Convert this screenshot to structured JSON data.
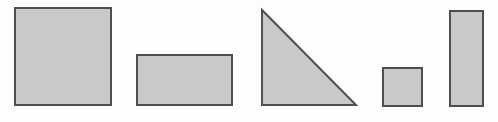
{
  "canvas": {
    "name": "geometric-shapes-figure",
    "width": 498,
    "height": 122,
    "background_color": "#fdfdfd",
    "baseline_y": 106,
    "shape_count": 5
  },
  "style": {
    "fill_color": "#c9c9c9",
    "stroke_color": "#4f4f4f",
    "stroke_width": 2
  },
  "shapes": [
    {
      "id": "shape-1",
      "name": "large-square",
      "kind": "square",
      "x": 15,
      "y": 8,
      "width": 96,
      "height": 97,
      "points": "",
      "fill": "#c9c9c9",
      "stroke": "#4f4f4f"
    },
    {
      "id": "shape-2",
      "name": "wide-rectangle",
      "kind": "rectangle",
      "x": 137,
      "y": 55,
      "width": 95,
      "height": 50,
      "points": "",
      "fill": "#c9c9c9",
      "stroke": "#4f4f4f"
    },
    {
      "id": "shape-3",
      "name": "right-triangle",
      "kind": "triangle",
      "x": 261,
      "y": 9,
      "width": 96,
      "height": 97,
      "points": "262,10 262,105 356,105",
      "fill": "#c9c9c9",
      "stroke": "#4f4f4f"
    },
    {
      "id": "shape-4",
      "name": "small-square",
      "kind": "square",
      "x": 383,
      "y": 68,
      "width": 39,
      "height": 38,
      "points": "",
      "fill": "#c9c9c9",
      "stroke": "#4f4f4f"
    },
    {
      "id": "shape-5",
      "name": "tall-rectangle",
      "kind": "rectangle",
      "x": 450,
      "y": 11,
      "width": 33,
      "height": 95,
      "points": "",
      "fill": "#c9c9c9",
      "stroke": "#4f4f4f"
    }
  ]
}
